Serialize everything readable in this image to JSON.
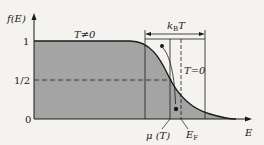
{
  "diagram": {
    "y_axis": {
      "label": "f(E)",
      "ticks": [
        "1",
        "1/2",
        "0"
      ]
    },
    "x_axis": {
      "label": "E"
    },
    "annotations": {
      "finite_temp": "T≠0",
      "zero_temp": "T=0",
      "thermal_width": "kBT",
      "thermal_width_main": "k",
      "thermal_width_sub": "B",
      "thermal_width_T": "T",
      "chemical_potential": "μ (T)",
      "fermi_energy": "E",
      "fermi_energy_sub": "F"
    },
    "colors": {
      "fill": "#a4a4a4",
      "line": "#1a1a1a",
      "background": "#f4f3f0"
    }
  }
}
